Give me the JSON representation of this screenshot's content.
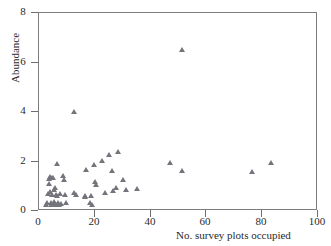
{
  "chart_data": {
    "type": "scatter",
    "title": "",
    "xlabel": "No. survey plots occupied",
    "ylabel": "Abundance",
    "xlim": [
      0,
      100
    ],
    "ylim": [
      0,
      8
    ],
    "xticks": [
      0,
      20,
      40,
      60,
      80,
      100
    ],
    "yticks": [
      0,
      2,
      4,
      6,
      8
    ],
    "grid": false,
    "legend": null,
    "marker": "triangle",
    "marker_color": "#74747c",
    "series": [
      {
        "name": "survey sites",
        "points": [
          [
            3.0,
            0.12
          ],
          [
            3.4,
            0.2
          ],
          [
            3.6,
            0.55
          ],
          [
            3.8,
            0.95
          ],
          [
            4.0,
            1.15
          ],
          [
            4.2,
            1.22
          ],
          [
            4.4,
            0.62
          ],
          [
            4.6,
            0.18
          ],
          [
            4.8,
            0.1
          ],
          [
            5.0,
            0.5
          ],
          [
            5.2,
            1.18
          ],
          [
            5.4,
            1.2
          ],
          [
            5.6,
            0.7
          ],
          [
            5.8,
            0.22
          ],
          [
            6.0,
            0.15
          ],
          [
            6.2,
            0.78
          ],
          [
            6.4,
            0.52
          ],
          [
            6.6,
            0.12
          ],
          [
            6.8,
            1.75
          ],
          [
            7.0,
            0.48
          ],
          [
            7.2,
            0.2
          ],
          [
            7.6,
            0.1
          ],
          [
            8.0,
            0.55
          ],
          [
            8.4,
            0.15
          ],
          [
            9.0,
            1.28
          ],
          [
            9.4,
            1.12
          ],
          [
            9.6,
            0.5
          ],
          [
            10.0,
            0.2
          ],
          [
            12.8,
            3.88
          ],
          [
            13.0,
            0.6
          ],
          [
            13.6,
            0.52
          ],
          [
            16.8,
            0.48
          ],
          [
            17.0,
            0.42
          ],
          [
            17.2,
            1.5
          ],
          [
            18.6,
            0.18
          ],
          [
            19.0,
            0.45
          ],
          [
            19.4,
            0.12
          ],
          [
            20.0,
            1.72
          ],
          [
            20.4,
            1.05
          ],
          [
            20.8,
            0.92
          ],
          [
            23.0,
            1.88
          ],
          [
            24.0,
            0.6
          ],
          [
            25.6,
            2.12
          ],
          [
            26.4,
            1.48
          ],
          [
            26.8,
            0.68
          ],
          [
            28.0,
            0.78
          ],
          [
            28.6,
            2.25
          ],
          [
            30.4,
            1.1
          ],
          [
            31.6,
            0.72
          ],
          [
            35.6,
            0.75
          ],
          [
            47.4,
            1.82
          ],
          [
            51.6,
            6.35
          ],
          [
            51.8,
            1.48
          ],
          [
            76.8,
            1.45
          ],
          [
            83.6,
            1.8
          ]
        ]
      }
    ]
  },
  "axes": {
    "y_title": "Abundance",
    "x_title": "No. survey plots occupied",
    "y_tick_labels": [
      "0",
      "2",
      "4",
      "6",
      "8"
    ],
    "x_tick_labels": [
      "0",
      "20",
      "40",
      "60",
      "80",
      "100"
    ]
  }
}
